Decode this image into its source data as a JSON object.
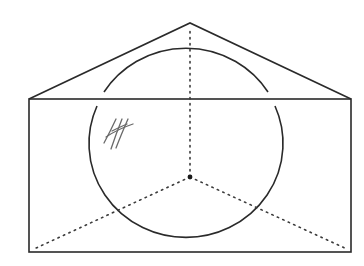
{
  "diagram": {
    "type": "geometry-sketch",
    "colors": {
      "stroke": "#2a2a2a",
      "dotted": "#3a3a3a",
      "handwriting": "#6a6a6a",
      "background": "#ffffff"
    },
    "rectangle": {
      "x1": 29,
      "y1": 99,
      "x2": 351,
      "y2": 252
    },
    "roof": {
      "apex": [
        190,
        23
      ],
      "left": [
        29,
        99
      ],
      "right": [
        351,
        99
      ]
    },
    "circle": {
      "cx": 186,
      "cy": 143,
      "rx": 97,
      "ry": 94
    },
    "center_point": [
      190,
      177
    ],
    "dotted_lines": [
      {
        "from": [
          190,
          177
        ],
        "to": [
          190,
          27
        ]
      },
      {
        "from": [
          190,
          177
        ],
        "to": [
          34,
          249
        ]
      },
      {
        "from": [
          190,
          177
        ],
        "to": [
          347,
          249
        ]
      }
    ],
    "handwritten_mark": {
      "label": "hash-like tally mark",
      "position": [
        118,
        134
      ]
    }
  }
}
